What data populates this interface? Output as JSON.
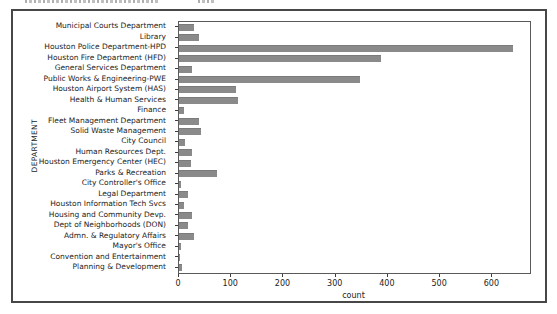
{
  "chart_data": {
    "type": "bar",
    "orientation": "horizontal",
    "title": "",
    "xlabel": "count",
    "ylabel": "DEPARTMENT",
    "xlim": [
      0,
      672
    ],
    "xticks": [
      0,
      100,
      200,
      300,
      400,
      500,
      600
    ],
    "grid": false,
    "legend": null,
    "categories": [
      "Municipal Courts Department",
      "Library",
      "Houston Police Department-HPD",
      "Houston Fire Department (HFD)",
      "General Services Department",
      "Public Works & Engineering-PWE",
      "Houston Airport System (HAS)",
      "Health & Human Services",
      "Finance",
      "Fleet Management Department",
      "Solid Waste Management",
      "City Council",
      "Human Resources Dept.",
      "Houston Emergency Center (HEC)",
      "Parks & Recreation",
      "City Controller's Office",
      "Legal Department",
      "Houston Information Tech Svcs",
      "Housing and Community Devp.",
      "Dept of Neighborhoods (DON)",
      "Admn. & Regulatory Affairs",
      "Mayor's Office",
      "Convention and Entertainment",
      "Planning & Development"
    ],
    "values": [
      29,
      38,
      640,
      386,
      24,
      347,
      109,
      112,
      10,
      39,
      43,
      11,
      25,
      23,
      73,
      4,
      17,
      9,
      24,
      17,
      29,
      4,
      2,
      6
    ],
    "colors": {
      "bar": "#8a8a8a",
      "frame_border": "#474747",
      "axes_spine": "#5a5a5a",
      "text": "#1c1c1c",
      "background": "#ffffff"
    }
  }
}
